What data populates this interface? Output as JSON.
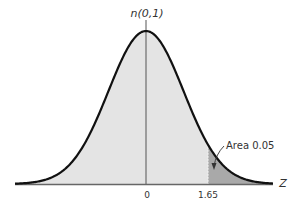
{
  "chart_data": {
    "type": "area",
    "title": "n(0,1)",
    "xlabel": "Z",
    "ylabel": "",
    "distribution": "standard normal",
    "mean": 0,
    "sd": 1,
    "tick_labels": [
      "0",
      "1.65"
    ],
    "ticks": [
      0,
      1.65
    ],
    "shaded_region": {
      "from": 1.65,
      "to": "inf",
      "label": "Area 0.05",
      "area": 0.05
    },
    "annotation": "Area 0.05",
    "xlim": [
      -3.5,
      3.4
    ],
    "grid": false,
    "legend": "none"
  },
  "labels": {
    "title": "n(0,1)",
    "axis": "Z",
    "tick_zero": "0",
    "tick_critical": "1.65",
    "area": "Area 0.05"
  },
  "colors": {
    "curve": "#111111",
    "body_fill": "#e4e4e4",
    "tail_fill": "#a9a9a9",
    "axis": "#555555"
  }
}
